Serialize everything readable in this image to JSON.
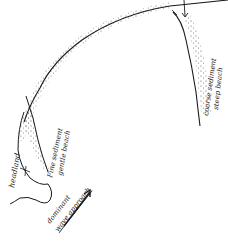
{
  "diagram": {
    "type": "hand-drawn coastal sketch",
    "labels": {
      "headland": "headland",
      "fine_line1": "Fine sediment",
      "fine_line2": "gentle beach",
      "coarse_line1": "coarse sediment",
      "coarse_line2": "steep beach",
      "wave_line1": "dominant",
      "wave_line2": "wave approach"
    },
    "colors": {
      "ink": "#1a1a1a",
      "stipple": "#555555",
      "background": "#ffffff"
    }
  }
}
